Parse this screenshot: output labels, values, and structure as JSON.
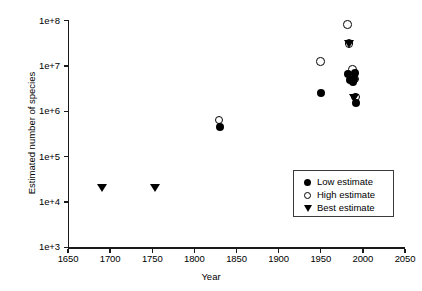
{
  "chart_data": {
    "type": "scatter",
    "title": "",
    "xlabel": "Year",
    "ylabel": "Estimated number of species",
    "xlim": [
      1650,
      2050
    ],
    "ylim": [
      1000,
      100000000
    ],
    "yscale": "log",
    "grid": false,
    "legend_position": "inside-right",
    "xticks": [
      1650,
      1700,
      1750,
      1800,
      1850,
      1900,
      1950,
      2000,
      2050
    ],
    "xticklabels": [
      "1650",
      "1700",
      "1750",
      "1800",
      "1850",
      "1900",
      "1950",
      "2000",
      "2050"
    ],
    "yticks": [
      1000,
      10000,
      100000,
      1000000,
      10000000,
      100000000
    ],
    "yticklabels": [
      "1e+3",
      "1e+4",
      "1e+5",
      "1e+6",
      "1e+7",
      "1e+8"
    ],
    "series": [
      {
        "name": "Low estimate",
        "marker": "filled-circle",
        "color": "#000000",
        "points": [
          {
            "x": 1830,
            "y": 450000
          },
          {
            "x": 1950,
            "y": 2500000
          },
          {
            "x": 1982,
            "y": 6500000
          },
          {
            "x": 1985,
            "y": 5000000
          },
          {
            "x": 1988,
            "y": 4500000
          },
          {
            "x": 1990,
            "y": 5200000
          },
          {
            "x": 1991,
            "y": 7000000
          },
          {
            "x": 1992,
            "y": 1500000
          }
        ]
      },
      {
        "name": "High estimate",
        "marker": "open-circle",
        "color": "#000000",
        "points": [
          {
            "x": 1830,
            "y": 620000
          },
          {
            "x": 1950,
            "y": 12000000
          },
          {
            "x": 1982,
            "y": 80000000
          },
          {
            "x": 1984,
            "y": 30000000
          },
          {
            "x": 1988,
            "y": 8000000
          },
          {
            "x": 1990,
            "y": 6000000
          },
          {
            "x": 1991,
            "y": 5000000
          },
          {
            "x": 1992,
            "y": 2000000
          }
        ]
      },
      {
        "name": "Best estimate",
        "marker": "filled-triangle",
        "color": "#000000",
        "points": [
          {
            "x": 1690,
            "y": 20000
          },
          {
            "x": 1753,
            "y": 20000
          },
          {
            "x": 1983,
            "y": 30000000
          },
          {
            "x": 1990,
            "y": 2000000
          }
        ]
      }
    ]
  },
  "legend": {
    "items": [
      {
        "label": "Low estimate",
        "marker": "filled-circle"
      },
      {
        "label": "High estimate",
        "marker": "open-circle"
      },
      {
        "label": "Best estimate",
        "marker": "filled-triangle"
      }
    ]
  }
}
